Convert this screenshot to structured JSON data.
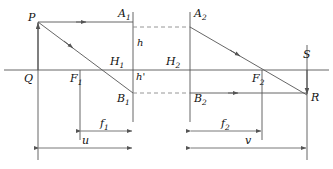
{
  "figure": {
    "type": "optical-ray-diagram",
    "background": "#ffffff",
    "line_color": "#555555",
    "dash_color": "#777777",
    "label_color": "#111111"
  },
  "labels": {
    "P": "P",
    "Q": "Q",
    "F1": "F",
    "F1sub": "1",
    "F2": "F",
    "F2sub": "2",
    "A1": "A",
    "A1sub": "1",
    "A2": "A",
    "A2sub": "2",
    "B1": "B",
    "B1sub": "1",
    "B2": "B",
    "B2sub": "2",
    "H1": "H",
    "H1sub": "1",
    "H2": "H",
    "H2sub": "2",
    "h": "h",
    "hprime": "h'",
    "S": "S",
    "R": "R",
    "f1": "f",
    "f1sub": "1",
    "f2": "f",
    "f2sub": "2",
    "u": "u",
    "v": "v"
  },
  "geometry": {
    "axis_y": 70,
    "object_x": 38,
    "object_top_y": 22,
    "plane1_x": 133,
    "plane2_x": 190,
    "image_x": 307,
    "image_bottom_y": 95,
    "upper_ray_y": 27,
    "lower_ray_y": 93,
    "focal1_x": 80,
    "focal2_x": 262,
    "dim_f_y": 131,
    "dim_uv_y": 148
  },
  "quantities": {
    "object_height_symbol": "h",
    "image_height_symbol": "h'",
    "object_distance_symbol": "u",
    "image_distance_symbol": "v",
    "focal_length_1_symbol": "f1",
    "focal_length_2_symbol": "f2"
  }
}
